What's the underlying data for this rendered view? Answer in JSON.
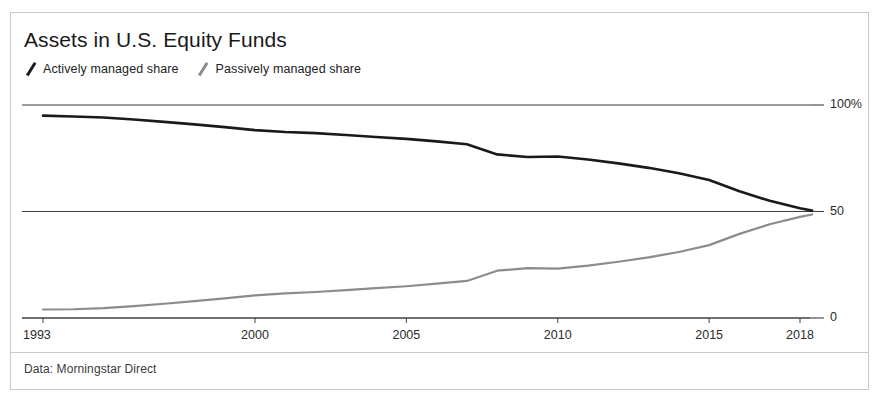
{
  "chart_data": {
    "type": "line",
    "title": "Assets in U.S. Equity Funds",
    "subtitle": "",
    "xlabel": "",
    "ylabel": "",
    "xlim": [
      1993,
      2018.4
    ],
    "ylim": [
      0,
      100
    ],
    "grid": true,
    "legend_position": "top-left",
    "x_ticks": [
      1993,
      2000,
      2005,
      2010,
      2015,
      2018
    ],
    "x_tick_labels": [
      "1993",
      "2000",
      "2005",
      "2010",
      "2015",
      "2018"
    ],
    "y_ticks": [
      0,
      50,
      100
    ],
    "y_tick_labels": [
      "0",
      "50",
      "100%"
    ],
    "x": [
      1993,
      1994,
      1995,
      1996,
      1997,
      1998,
      1999,
      2000,
      2001,
      2002,
      2003,
      2004,
      2005,
      2006,
      2007,
      2008,
      2009,
      2010,
      2011,
      2012,
      2013,
      2014,
      2015,
      2016,
      2017,
      2018,
      2018.4
    ],
    "series": [
      {
        "name": "Actively managed share",
        "color": "#1a1a1a",
        "values": [
          95.0,
          94.6,
          94.1,
          93.2,
          92.1,
          90.9,
          89.6,
          88.2,
          87.3,
          86.8,
          85.9,
          85.0,
          84.1,
          82.9,
          81.6,
          76.8,
          75.6,
          75.8,
          74.4,
          72.6,
          70.5,
          68.0,
          64.8,
          59.5,
          55.0,
          51.5,
          50.4
        ]
      },
      {
        "name": "Passively managed share",
        "color": "#8c8c8c",
        "values": [
          4.0,
          4.1,
          4.6,
          5.6,
          6.7,
          7.9,
          9.2,
          10.6,
          11.6,
          12.2,
          13.1,
          14.0,
          14.9,
          16.1,
          17.4,
          22.2,
          23.4,
          23.2,
          24.6,
          26.4,
          28.5,
          31.0,
          34.2,
          39.5,
          44.0,
          47.5,
          48.6
        ]
      }
    ],
    "annotations": []
  },
  "header": {
    "title": "Assets in U.S. Equity Funds",
    "legend": [
      {
        "label": "Actively managed share",
        "color": "#1a1a1a",
        "marker": "slash-marker-icon"
      },
      {
        "label": "Passively managed share",
        "color": "#8c8c8c",
        "marker": "slash-marker-icon"
      }
    ]
  },
  "footer": {
    "source_note": "Data: Morningstar Direct"
  },
  "colors": {
    "active_line": "#1a1a1a",
    "passive_line": "#8c8c8c",
    "gridline": "#3f3f3f",
    "frame": "#c9c9c9",
    "text": "#1a1a1a"
  }
}
